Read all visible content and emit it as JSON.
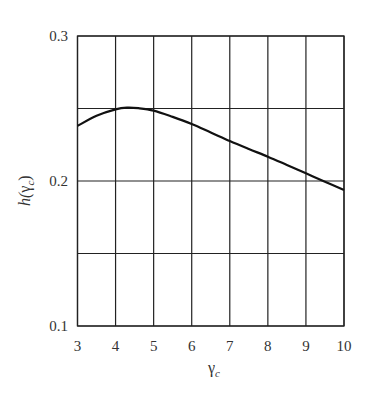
{
  "chart_data": {
    "type": "line",
    "title": "",
    "xlabel": "γc",
    "ylabel": "h(γc)",
    "xlim": [
      3,
      10
    ],
    "ylim": [
      0.1,
      0.3
    ],
    "grid": true,
    "legend": null,
    "x_ticks": [
      3,
      4,
      5,
      6,
      7,
      8,
      9,
      10
    ],
    "x_tick_labels": [
      "3",
      "4",
      "5",
      "6",
      "7",
      "8",
      "9",
      "10"
    ],
    "y_ticks": [
      0.1,
      0.15,
      0.2,
      0.25,
      0.3
    ],
    "y_tick_labels": [
      "0.1",
      "",
      "0.2",
      "",
      "0.3"
    ],
    "series": [
      {
        "name": "h(γc)",
        "x": [
          3,
          3.5,
          4,
          4.3,
          4.6,
          5,
          5.5,
          6,
          6.5,
          7,
          7.5,
          8,
          8.5,
          9,
          9.5,
          10
        ],
        "y": [
          0.238,
          0.245,
          0.2494,
          0.2506,
          0.2502,
          0.2485,
          0.2442,
          0.2393,
          0.2335,
          0.2276,
          0.2221,
          0.2168,
          0.2111,
          0.2053,
          0.1995,
          0.1938
        ]
      }
    ]
  },
  "axes": {
    "x_label_main": "γ",
    "x_label_sub": "c",
    "y_label_prefix": "h(",
    "y_label_gamma": "γ",
    "y_label_sub": "c",
    "y_label_suffix": ")"
  }
}
